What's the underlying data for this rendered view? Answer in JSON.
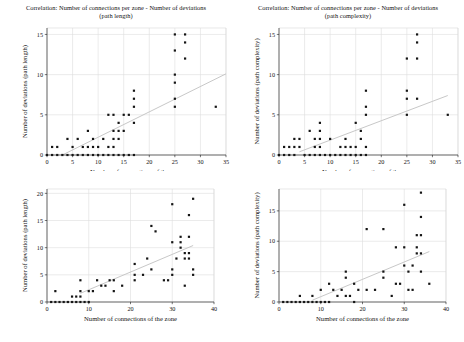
{
  "figure": {
    "background_color": "#ffffff",
    "point_color": "#141414",
    "trend_color": "#c8c8c8",
    "grid_color": "#dedede"
  },
  "panels": {
    "top_left": {
      "title_line1": "Correlation: Number of connections per zone - Number of deviations",
      "title_line2": "(path length)",
      "xlabel": "Number of connections of the zone",
      "ylabel": "Number of deviations (path length)"
    },
    "top_right": {
      "title_line1": "Correlation: Number of connections per zone - Number of deviations",
      "title_line2": "(path complexity)",
      "xlabel": "Number of connections of the zone",
      "ylabel": "Number of deviations (path complexity)"
    },
    "bottom_left": {
      "title_line1": "",
      "title_line2": "",
      "xlabel": "Number of connections of the zone",
      "ylabel": "Number of deviations (path length)"
    },
    "bottom_right": {
      "title_line1": "",
      "title_line2": "",
      "xlabel": "Number of connections of the zone",
      "ylabel": "Number of deviations (path complexity)"
    }
  },
  "chart_data": [
    {
      "id": "top_left",
      "type": "scatter",
      "title": "Correlation: Number of connections per zone - Number of deviations (path length)",
      "xlabel": "Number of connections of the zone",
      "ylabel": "Number of deviations (path length)",
      "xlim": [
        0,
        35
      ],
      "ylim": [
        0,
        15.8
      ],
      "xticks": [
        0,
        5,
        10,
        15,
        20,
        25,
        30,
        35
      ],
      "yticks": [
        0,
        5,
        10,
        15
      ],
      "grid": true,
      "legend": "none",
      "trendline": {
        "x": [
          3,
          35
        ],
        "y": [
          0,
          10.1
        ]
      },
      "points": [
        [
          0,
          0
        ],
        [
          1,
          0
        ],
        [
          1,
          1
        ],
        [
          2,
          0
        ],
        [
          2,
          1
        ],
        [
          3,
          0
        ],
        [
          4,
          0
        ],
        [
          4,
          2
        ],
        [
          5,
          0
        ],
        [
          5,
          1
        ],
        [
          6,
          0
        ],
        [
          6,
          2
        ],
        [
          7,
          0
        ],
        [
          7,
          1
        ],
        [
          8,
          0
        ],
        [
          8,
          1
        ],
        [
          8,
          3
        ],
        [
          9,
          0
        ],
        [
          9,
          1
        ],
        [
          9,
          2
        ],
        [
          10,
          0
        ],
        [
          10,
          1
        ],
        [
          11,
          0
        ],
        [
          11,
          2
        ],
        [
          12,
          0
        ],
        [
          12,
          1
        ],
        [
          12,
          5
        ],
        [
          13,
          0
        ],
        [
          13,
          1
        ],
        [
          13,
          2
        ],
        [
          13,
          3
        ],
        [
          13,
          5
        ],
        [
          14,
          0
        ],
        [
          14,
          2
        ],
        [
          14,
          3
        ],
        [
          14,
          4
        ],
        [
          15,
          0
        ],
        [
          15,
          3
        ],
        [
          15,
          5
        ],
        [
          16,
          0
        ],
        [
          16,
          5
        ],
        [
          17,
          0
        ],
        [
          17,
          4
        ],
        [
          17,
          6
        ],
        [
          17,
          7
        ],
        [
          17,
          8
        ],
        [
          25,
          6
        ],
        [
          25,
          7
        ],
        [
          25,
          9
        ],
        [
          25,
          10
        ],
        [
          25,
          13
        ],
        [
          25,
          15
        ],
        [
          27,
          12
        ],
        [
          27,
          14
        ],
        [
          27,
          15
        ],
        [
          33,
          6
        ]
      ]
    },
    {
      "id": "top_right",
      "type": "scatter",
      "title": "Correlation: Number of connections per zone - Number of deviations (path complexity)",
      "xlabel": "Number of connections of the zone",
      "ylabel": "Number of deviations (path complexity)",
      "xlim": [
        0,
        35
      ],
      "ylim": [
        0,
        15.8
      ],
      "xticks": [
        0,
        5,
        10,
        15,
        20,
        25,
        30,
        35
      ],
      "yticks": [
        0,
        5,
        10,
        15
      ],
      "grid": true,
      "legend": "none",
      "trendline": {
        "x": [
          4,
          33
        ],
        "y": [
          0.4,
          7.4
        ]
      },
      "points": [
        [
          0,
          0
        ],
        [
          1,
          0
        ],
        [
          1,
          1
        ],
        [
          2,
          0
        ],
        [
          2,
          1
        ],
        [
          3,
          0
        ],
        [
          3,
          1
        ],
        [
          3,
          2
        ],
        [
          4,
          1
        ],
        [
          4,
          2
        ],
        [
          5,
          0
        ],
        [
          6,
          0
        ],
        [
          6,
          3
        ],
        [
          7,
          0
        ],
        [
          7,
          1
        ],
        [
          7,
          2
        ],
        [
          8,
          0
        ],
        [
          8,
          1
        ],
        [
          8,
          2
        ],
        [
          8,
          3
        ],
        [
          8,
          4
        ],
        [
          9,
          0
        ],
        [
          10,
          0
        ],
        [
          10,
          2
        ],
        [
          11,
          0
        ],
        [
          12,
          0
        ],
        [
          12,
          1
        ],
        [
          13,
          0
        ],
        [
          13,
          1
        ],
        [
          13,
          2
        ],
        [
          14,
          0
        ],
        [
          14,
          1
        ],
        [
          15,
          0
        ],
        [
          15,
          1
        ],
        [
          15,
          4
        ],
        [
          16,
          0
        ],
        [
          16,
          2
        ],
        [
          16,
          3
        ],
        [
          17,
          0
        ],
        [
          17,
          1
        ],
        [
          17,
          5
        ],
        [
          17,
          6
        ],
        [
          17,
          8
        ],
        [
          25,
          5
        ],
        [
          25,
          7
        ],
        [
          25,
          8
        ],
        [
          25,
          12
        ],
        [
          27,
          7
        ],
        [
          27,
          12
        ],
        [
          27,
          14
        ],
        [
          27,
          15
        ],
        [
          33,
          5
        ]
      ]
    },
    {
      "id": "bottom_left",
      "type": "scatter",
      "title": "",
      "xlabel": "Number of connections of the zone",
      "ylabel": "Number of deviations (path length)",
      "xlim": [
        0,
        40
      ],
      "ylim": [
        0,
        20.8
      ],
      "xticks": [
        0,
        10,
        20,
        30,
        40
      ],
      "yticks": [
        0,
        5,
        10,
        15,
        20
      ],
      "grid": true,
      "legend": "none",
      "trendline": {
        "x": [
          8,
          35
        ],
        "y": [
          1.6,
          10.4
        ]
      },
      "points": [
        [
          1,
          0
        ],
        [
          2,
          0
        ],
        [
          2,
          2
        ],
        [
          3,
          0
        ],
        [
          4,
          0
        ],
        [
          5,
          0
        ],
        [
          6,
          0
        ],
        [
          6,
          1
        ],
        [
          7,
          0
        ],
        [
          7,
          1
        ],
        [
          8,
          0
        ],
        [
          8,
          1
        ],
        [
          8,
          2
        ],
        [
          8,
          4
        ],
        [
          9,
          0
        ],
        [
          10,
          0
        ],
        [
          10,
          2
        ],
        [
          11,
          2
        ],
        [
          12,
          4
        ],
        [
          13,
          3
        ],
        [
          14,
          3
        ],
        [
          15,
          4
        ],
        [
          16,
          2
        ],
        [
          16,
          4
        ],
        [
          18,
          3
        ],
        [
          21,
          4
        ],
        [
          21,
          5
        ],
        [
          21,
          7
        ],
        [
          23,
          5
        ],
        [
          24,
          8
        ],
        [
          25,
          6
        ],
        [
          25,
          14
        ],
        [
          26,
          13
        ],
        [
          28,
          4
        ],
        [
          29,
          4
        ],
        [
          30,
          5
        ],
        [
          30,
          6
        ],
        [
          30,
          11
        ],
        [
          30,
          18
        ],
        [
          31,
          8
        ],
        [
          32,
          10
        ],
        [
          32,
          11
        ],
        [
          32,
          12
        ],
        [
          33,
          3
        ],
        [
          33,
          8
        ],
        [
          33,
          9
        ],
        [
          34,
          8
        ],
        [
          34,
          9
        ],
        [
          34,
          12
        ],
        [
          34,
          16
        ],
        [
          35,
          5
        ],
        [
          35,
          6
        ],
        [
          35,
          19
        ]
      ]
    },
    {
      "id": "bottom_right",
      "type": "scatter",
      "title": "",
      "xlabel": "Number of connections of the zone",
      "ylabel": "Number of deviations (path complexity)",
      "xlim": [
        0,
        40
      ],
      "ylim": [
        0,
        18.6
      ],
      "xticks": [
        0,
        10,
        20,
        30,
        40
      ],
      "yticks": [
        0,
        5,
        10,
        15
      ],
      "grid": true,
      "legend": "none",
      "trendline": {
        "x": [
          8,
          36
        ],
        "y": [
          0.3,
          8.3
        ]
      },
      "points": [
        [
          1,
          0
        ],
        [
          2,
          0
        ],
        [
          3,
          0
        ],
        [
          4,
          0
        ],
        [
          5,
          0
        ],
        [
          5,
          1
        ],
        [
          6,
          0
        ],
        [
          7,
          0
        ],
        [
          8,
          0
        ],
        [
          8,
          1
        ],
        [
          9,
          0
        ],
        [
          10,
          0
        ],
        [
          10,
          2
        ],
        [
          11,
          0
        ],
        [
          12,
          0
        ],
        [
          12,
          3
        ],
        [
          13,
          2
        ],
        [
          14,
          1
        ],
        [
          15,
          2
        ],
        [
          16,
          1
        ],
        [
          16,
          4
        ],
        [
          16,
          5
        ],
        [
          17,
          1
        ],
        [
          18,
          0
        ],
        [
          18,
          3
        ],
        [
          19,
          2
        ],
        [
          21,
          2
        ],
        [
          21,
          12
        ],
        [
          23,
          2
        ],
        [
          25,
          4
        ],
        [
          25,
          5
        ],
        [
          25,
          12
        ],
        [
          27,
          1
        ],
        [
          28,
          3
        ],
        [
          28,
          9
        ],
        [
          29,
          3
        ],
        [
          30,
          6
        ],
        [
          30,
          9
        ],
        [
          30,
          16
        ],
        [
          31,
          2
        ],
        [
          31,
          5
        ],
        [
          32,
          2
        ],
        [
          32,
          6
        ],
        [
          33,
          8
        ],
        [
          33,
          9
        ],
        [
          33,
          11
        ],
        [
          34,
          5
        ],
        [
          34,
          8
        ],
        [
          34,
          11
        ],
        [
          34,
          14
        ],
        [
          34,
          18
        ],
        [
          36,
          3
        ]
      ]
    }
  ]
}
